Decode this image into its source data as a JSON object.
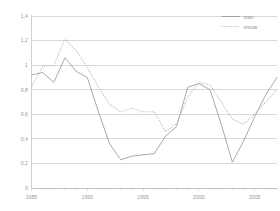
{
  "chart_data": {
    "type": "line",
    "title": "",
    "subtitle": "",
    "xlabel": "",
    "ylabel": "",
    "xlim": [
      1985,
      2007
    ],
    "ylim": [
      0,
      1.4
    ],
    "ytick_step": 0.2,
    "grid": true,
    "legend_position": "top-right",
    "decimal_separator": ",",
    "x": [
      1985,
      1986,
      1987,
      1988,
      1989,
      1990,
      1991,
      1992,
      1993,
      1994,
      1995,
      1996,
      1997,
      1998,
      1999,
      2000,
      2001,
      2002,
      2003,
      2004,
      2005,
      2006,
      2007
    ],
    "xtick_labels": [
      "1985",
      "1990",
      "1995",
      "2000",
      "2005"
    ],
    "xtick_values": [
      1985,
      1990,
      1995,
      2000,
      2005
    ],
    "ytick_labels": [
      "0",
      "0,2",
      "0,4",
      "0,6",
      "0,8",
      "1",
      "1,2",
      "1,4"
    ],
    "ytick_values": [
      0,
      0.2,
      0.4,
      0.6,
      0.8,
      1.0,
      1.2,
      1.4
    ],
    "series": [
      {
        "name": "man",
        "style": "solid",
        "color": "#8c8c8c",
        "values": [
          0.92,
          0.94,
          0.86,
          1.06,
          0.95,
          0.9,
          0.62,
          0.36,
          0.23,
          0.26,
          0.27,
          0.28,
          0.42,
          0.5,
          0.82,
          0.85,
          0.8,
          0.52,
          0.21,
          0.38,
          0.58,
          0.76,
          0.9
        ]
      },
      {
        "name": "vrouw",
        "style": "dotted",
        "color": "#b4b4b4",
        "values": [
          0.82,
          0.99,
          1.0,
          1.21,
          1.12,
          0.98,
          0.82,
          0.68,
          0.62,
          0.65,
          0.62,
          0.62,
          0.46,
          0.52,
          0.74,
          0.86,
          0.84,
          0.7,
          0.56,
          0.52,
          0.6,
          0.7,
          0.8
        ]
      }
    ]
  },
  "legend": {
    "entries": [
      {
        "label": "man",
        "style": "solid"
      },
      {
        "label": "vrouw",
        "style": "dotted"
      }
    ]
  },
  "axes": {
    "y_axis_name": "value-axis",
    "x_axis_name": "year-axis"
  }
}
